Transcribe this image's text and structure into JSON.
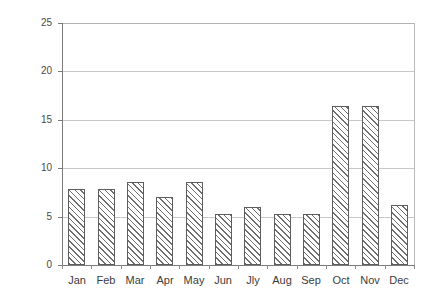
{
  "chart_data": {
    "type": "bar",
    "title": "",
    "xlabel": "",
    "ylabel": "Percentage share",
    "ylim": [
      0,
      25
    ],
    "ytick_values": [
      0,
      5,
      10,
      15,
      20,
      25
    ],
    "ytick_labels": [
      "0",
      "5",
      "10",
      "15",
      "20",
      "25"
    ],
    "grid": true,
    "grid_axis": "y",
    "legend": false,
    "categories": [
      "Jan",
      "Feb",
      "Mar",
      "Apr",
      "May",
      "Jun",
      "Jly",
      "Aug",
      "Sep",
      "Oct",
      "Nov",
      "Dec"
    ],
    "values": [
      7.8,
      7.8,
      8.6,
      7.0,
      8.6,
      5.3,
      6.0,
      5.3,
      5.3,
      16.4,
      16.4,
      6.2
    ],
    "series": [
      {
        "name": "Percentage share",
        "values": [
          7.8,
          7.8,
          8.6,
          7.0,
          8.6,
          5.3,
          6.0,
          5.3,
          5.3,
          16.4,
          16.4,
          6.2
        ]
      }
    ],
    "bar_style": {
      "fill": "#ffffff",
      "hatch": "/",
      "hatch_color": "#6f6f6f",
      "edge_color": "#5d5d5d"
    },
    "axis_color": "#7a7a7a",
    "gridline_color": "#c9c9c9",
    "background": "#ffffff"
  },
  "axis": {
    "y_title": "Percentage share",
    "ticks": [
      {
        "label": "25",
        "value": 25
      },
      {
        "label": "20",
        "value": 20
      },
      {
        "label": "15",
        "value": 15
      },
      {
        "label": "10",
        "value": 10
      },
      {
        "label": "5",
        "value": 5
      },
      {
        "label": "0",
        "value": 0
      }
    ]
  },
  "bars": [
    {
      "category": "Jan",
      "value": 7.8
    },
    {
      "category": "Feb",
      "value": 7.8
    },
    {
      "category": "Mar",
      "value": 8.6
    },
    {
      "category": "Apr",
      "value": 7.0
    },
    {
      "category": "May",
      "value": 8.6
    },
    {
      "category": "Jun",
      "value": 5.3
    },
    {
      "category": "Jly",
      "value": 6.0
    },
    {
      "category": "Aug",
      "value": 5.3
    },
    {
      "category": "Sep",
      "value": 5.3
    },
    {
      "category": "Oct",
      "value": 16.4
    },
    {
      "category": "Nov",
      "value": 16.4
    },
    {
      "category": "Dec",
      "value": 6.2
    }
  ]
}
